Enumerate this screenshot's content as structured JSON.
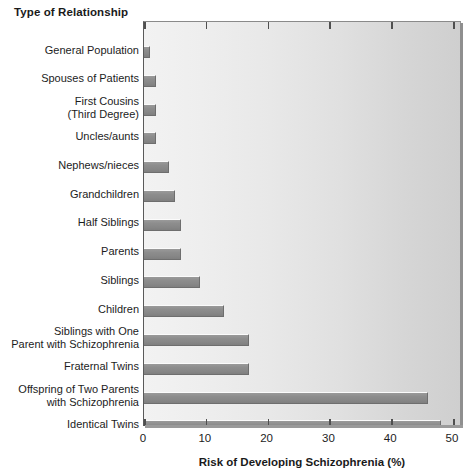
{
  "chart_data": {
    "type": "bar",
    "orientation": "horizontal",
    "title": "",
    "ylabel": "Type of Relationship",
    "xlabel": "Risk of Developing Schizophrenia (%)",
    "xlim": [
      0,
      50
    ],
    "xticks": [
      0,
      10,
      20,
      30,
      40,
      50
    ],
    "xtick_labels": [
      "0",
      "10",
      "20",
      "30",
      "40",
      "50"
    ],
    "grid": false,
    "legend": null,
    "categories": [
      "General Population",
      "Spouses of Patients",
      "First Cousins\n(Third Degree)",
      "Uncles/aunts",
      "Nephews/nieces",
      "Grandchildren",
      "Half Siblings",
      "Parents",
      "Siblings",
      "Children",
      "Siblings with One\nParent with Schizophrenia",
      "Fraternal Twins",
      "Offspring of Two Parents\nwith Schizophrenia",
      "Identical Twins"
    ],
    "values": [
      1,
      2,
      2,
      2,
      4,
      5,
      6,
      6,
      9,
      13,
      17,
      17,
      46,
      48
    ],
    "bars": [
      {
        "label_lines": [
          "General Population"
        ],
        "value": 1
      },
      {
        "label_lines": [
          "Spouses of Patients"
        ],
        "value": 2
      },
      {
        "label_lines": [
          "First Cousins",
          "(Third Degree)"
        ],
        "value": 2
      },
      {
        "label_lines": [
          "Uncles/aunts"
        ],
        "value": 2
      },
      {
        "label_lines": [
          "Nephews/nieces"
        ],
        "value": 4
      },
      {
        "label_lines": [
          "Grandchildren"
        ],
        "value": 5
      },
      {
        "label_lines": [
          "Half Siblings"
        ],
        "value": 6
      },
      {
        "label_lines": [
          "Parents"
        ],
        "value": 6
      },
      {
        "label_lines": [
          "Siblings"
        ],
        "value": 9
      },
      {
        "label_lines": [
          "Children"
        ],
        "value": 13
      },
      {
        "label_lines": [
          "Siblings with One",
          "Parent with Schizophrenia"
        ],
        "value": 17
      },
      {
        "label_lines": [
          "Fraternal Twins"
        ],
        "value": 17
      },
      {
        "label_lines": [
          "Offspring of Two Parents",
          "with Schizophrenia"
        ],
        "value": 46
      },
      {
        "label_lines": [
          "Identical Twins"
        ],
        "value": 48
      }
    ],
    "colors": {
      "bar_fill": "#8a8a8a",
      "bar_highlight": "#fbfbfb",
      "bar_edge": "#6e6e6e",
      "plot_background_light": "#f2f2f2",
      "plot_background_dark": "#cfcfcf",
      "axis": "#4f4f4f",
      "text": "#1a1a1a",
      "page_background": "#ffffff"
    }
  }
}
